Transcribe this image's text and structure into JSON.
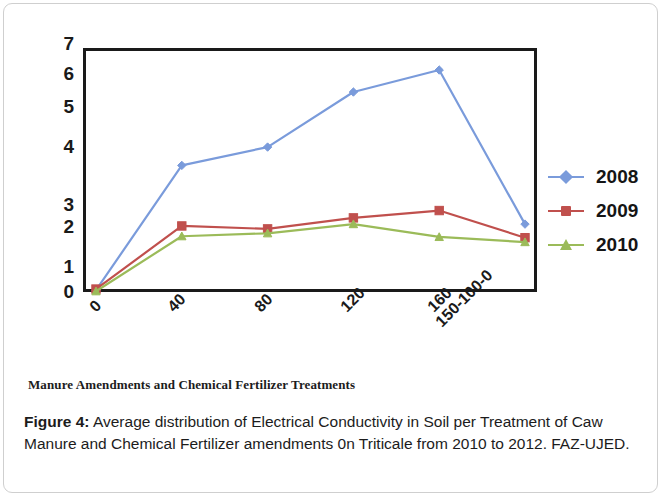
{
  "figure": {
    "caption_label": "Figure 4",
    "caption_separator": ":",
    "caption_text": " Average distribution of Electrical Conductivity in Soil per Treatment of Caw Manure and Chemical Fertilizer amendments 0n Triticale from 2010 to 2012. FAZ-UJED.",
    "axis_title": "Manure Amendments and Chemical Fertilizer Treatments"
  },
  "chart_data": {
    "type": "line",
    "title": "",
    "xlabel": "Manure Amendments and Chemical Fertilizer Treatments",
    "ylabel": "",
    "categories": [
      "0",
      "40",
      "80",
      "120",
      "160",
      "150-100-0"
    ],
    "yticks": [
      7,
      6,
      5,
      4,
      3,
      2,
      1,
      0
    ],
    "ylim": [
      0,
      6.65
    ],
    "grid": false,
    "legend_position": "right",
    "series": [
      {
        "name": "2008",
        "color": "#7a9bdb",
        "marker": "diamond",
        "values": [
          0.05,
          3.45,
          3.95,
          5.45,
          6.05,
          1.85
        ]
      },
      {
        "name": "2009",
        "color": "#c0504d",
        "marker": "square",
        "values": [
          0.08,
          1.8,
          1.72,
          2.02,
          2.22,
          1.48
        ]
      },
      {
        "name": "2010",
        "color": "#9bbb59",
        "marker": "triangle",
        "values": [
          0.02,
          1.52,
          1.6,
          1.85,
          1.5,
          1.36
        ]
      }
    ]
  },
  "axis_render": {
    "ytick_pixel_tops": [
      34,
      64,
      97,
      137,
      195,
      217,
      257,
      282
    ]
  }
}
